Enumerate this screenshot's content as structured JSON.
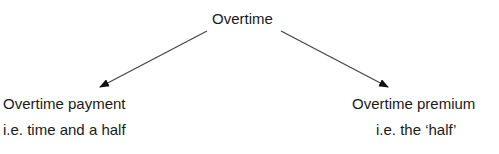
{
  "diagram": {
    "root": {
      "label": "Overtime"
    },
    "children": [
      {
        "title": "Overtime payment",
        "subtitle": "i.e. time and a half"
      },
      {
        "title": "Overtime premium",
        "subtitle": "i.e. the ‘half’"
      }
    ],
    "arrow_color": "#333333"
  }
}
